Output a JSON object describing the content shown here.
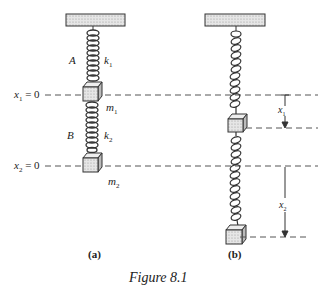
{
  "figure": {
    "caption": "Figure 8.1",
    "panel_a": {
      "label": "(a)",
      "spring_top_letter": "A",
      "spring_top_constant": "k",
      "spring_top_constant_sub": "1",
      "mass_top": "m",
      "mass_top_sub": "1",
      "spring_bottom_letter": "B",
      "spring_bottom_constant": "k",
      "spring_bottom_constant_sub": "2",
      "mass_bottom": "m",
      "mass_bottom_sub": "2",
      "ref_line_1": "x",
      "ref_line_1_sub": "1",
      "ref_line_1_eq": " = 0",
      "ref_line_2": "x",
      "ref_line_2_sub": "2",
      "ref_line_2_eq": " = 0"
    },
    "panel_b": {
      "label": "(b)",
      "displacement_1": "x",
      "displacement_1_sub": "1",
      "displacement_2": "x",
      "displacement_2_sub": "2"
    },
    "colors": {
      "line": "#333333",
      "fill": "#d8d8d8",
      "dash": "#555555"
    }
  }
}
